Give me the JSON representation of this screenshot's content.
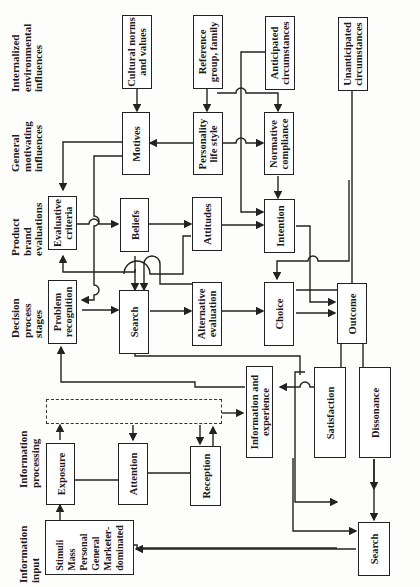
{
  "row_labels": [
    {
      "id": "internalized",
      "text": "Internalized\nenvironmental\ninfluences"
    },
    {
      "id": "motivating",
      "text": "General\nmotivating\ninfluences"
    },
    {
      "id": "evaluations",
      "text": "Product\nbrand\nevaluations"
    },
    {
      "id": "decision",
      "text": "Decision\nprocess\nstages"
    },
    {
      "id": "processing",
      "text": "Information\nprocessing"
    },
    {
      "id": "input",
      "text": "Information\ninput"
    }
  ],
  "boxes": {
    "cultural_norms": "Cultural norms\nand values",
    "reference_group": "Reference\ngroup, family",
    "anticipated": "Anticipated\ncircumstances",
    "unanticipated": "Unanticipated\ncircumstances",
    "motives": "Motives",
    "personality": "Personality\nlife style",
    "normative": "Normative\ncompliance",
    "evaluative_criteria": "Evaluative\ncriteria",
    "beliefs": "Beliefs",
    "attitudes": "Attitudes",
    "intention": "Intention",
    "problem_recognition": "Problem\nrecognition",
    "search_decision": "Search",
    "alternative_evaluation": "Alternative\nevaluation",
    "choice": "Choice",
    "outcome": "Outcome",
    "info_experience": "Information and\nexperience",
    "satisfaction": "Satisfaction",
    "dissonance": "Dissonance",
    "exposure": "Exposure",
    "attention": "Attention",
    "reception": "Reception",
    "stimuli": "Stimuli\nMass\nPersonal\nGeneral\nMarketer-\ndominated",
    "search_input": "Search"
  },
  "colors": {
    "line": "#222222",
    "background": "#fdfdfc"
  }
}
